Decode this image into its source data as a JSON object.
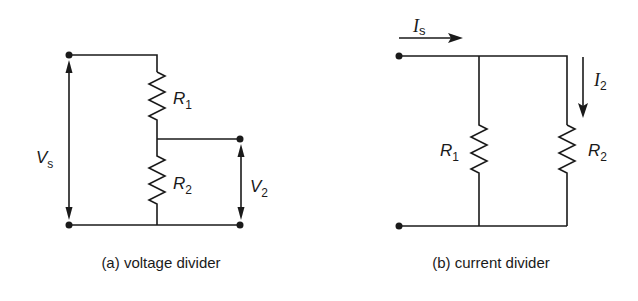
{
  "diagram_a": {
    "caption": "(a) voltage divider",
    "source_voltage": {
      "symbol": "V",
      "subscript": "s"
    },
    "output_voltage": {
      "symbol": "V",
      "subscript": "2"
    },
    "resistor_1": {
      "symbol": "R",
      "subscript": "1"
    },
    "resistor_2": {
      "symbol": "R",
      "subscript": "2"
    }
  },
  "diagram_b": {
    "caption": "(b) current divider",
    "source_current": {
      "symbol": "I",
      "subscript": "s"
    },
    "branch_current": {
      "symbol": "I",
      "subscript": "2"
    },
    "resistor_1": {
      "symbol": "R",
      "subscript": "1"
    },
    "resistor_2": {
      "symbol": "R",
      "subscript": "2"
    }
  },
  "colors": {
    "ink": "#1a1a1a",
    "background": "#ffffff"
  }
}
